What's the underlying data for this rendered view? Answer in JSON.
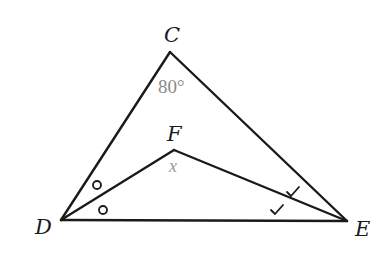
{
  "diagram": {
    "type": "geometry-triangle",
    "vertices": {
      "C": {
        "label": "C",
        "x": 170,
        "y": 52
      },
      "D": {
        "label": "D",
        "x": 61,
        "y": 220
      },
      "E": {
        "label": "E",
        "x": 347,
        "y": 221
      },
      "F": {
        "label": "F",
        "x": 174,
        "y": 150
      }
    },
    "segments": [
      {
        "from": "C",
        "to": "D"
      },
      {
        "from": "C",
        "to": "E"
      },
      {
        "from": "D",
        "to": "E"
      },
      {
        "from": "D",
        "to": "F"
      },
      {
        "from": "F",
        "to": "E"
      }
    ],
    "angles": {
      "C": {
        "label": "80°"
      },
      "F": {
        "label": "x"
      }
    },
    "markings": {
      "D_bisector": {
        "symbol": "circle",
        "count": 2,
        "meaning": "angle CDF = angle FDE"
      },
      "E_bisector": {
        "symbol": "check",
        "count": 2,
        "meaning": "angle CEF = angle FED"
      }
    },
    "colors": {
      "lines": "#1a1a1a",
      "angle_label": "#8a8a8a",
      "background": "#ffffff"
    }
  }
}
